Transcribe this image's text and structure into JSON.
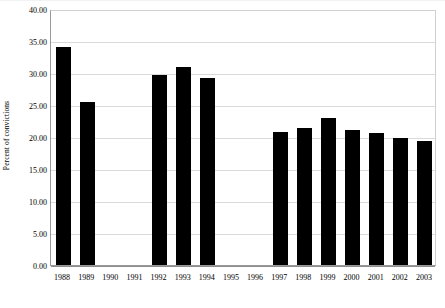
{
  "chart_data": {
    "type": "bar",
    "title": "",
    "subtitle": "",
    "xlabel": "",
    "ylabel": "Percent of convictions",
    "categories": [
      "1988",
      "1989",
      "1990",
      "1991",
      "1992",
      "1993",
      "1994",
      "1995",
      "1996",
      "1997",
      "1998",
      "1999",
      "2000",
      "2001",
      "2002",
      "2003"
    ],
    "values": [
      34.0,
      25.5,
      0,
      0,
      29.7,
      31.0,
      29.2,
      0,
      0,
      20.8,
      21.4,
      22.9,
      21.1,
      20.7,
      19.9,
      19.3
    ],
    "ylim": [
      0,
      40
    ],
    "ytick_labels": [
      "0.00",
      "5.00",
      "10.00",
      "15.00",
      "20.00",
      "25.00",
      "30.00",
      "35.00",
      "40.00"
    ],
    "ytick_values": [
      0,
      5,
      10,
      15,
      20,
      25,
      30,
      35,
      40
    ],
    "grid": true,
    "legend": false,
    "legend_position": "none",
    "bar_color": "#000000",
    "background_color": "#ffffff",
    "gridline_color": "#d9d9d9",
    "axis_color": "#8d8d8d"
  }
}
